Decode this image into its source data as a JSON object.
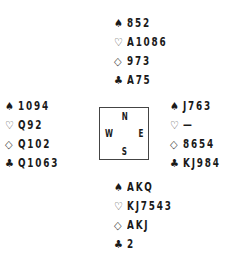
{
  "suits": {
    "spades": "♠",
    "hearts": "♡",
    "diamonds": "◇",
    "clubs": "♣"
  },
  "compass": {
    "n": "N",
    "s": "S",
    "w": "W",
    "e": "E"
  },
  "hands": {
    "north": {
      "spades": "852",
      "hearts": "A1086",
      "diamonds": "973",
      "clubs": "A75"
    },
    "west": {
      "spades": "1094",
      "hearts": "Q92",
      "diamonds": "Q102",
      "clubs": "Q1063"
    },
    "east": {
      "spades": "J763",
      "hearts": "—",
      "diamonds": "8654",
      "clubs": "KJ984"
    },
    "south": {
      "spades": "AKQ",
      "hearts": "KJ7543",
      "diamonds": "AKJ",
      "clubs": "2"
    }
  }
}
